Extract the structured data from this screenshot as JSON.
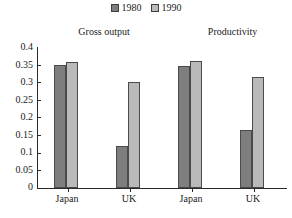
{
  "chart_data": {
    "type": "bar",
    "title": "",
    "subtitle": "",
    "xlabel": "",
    "ylabel": "",
    "ylim": [
      0,
      0.4
    ],
    "yticks": [
      "0",
      "0.05",
      "0.1",
      "0.15",
      "0.2",
      "0.25",
      "0.3",
      "0.35",
      "0.4"
    ],
    "ytick_values": [
      0,
      0.05,
      0.1,
      0.15,
      0.2,
      0.25,
      0.3,
      0.35,
      0.4
    ],
    "grid": false,
    "legend_position": "top-center",
    "group_labels": [
      "Gross output",
      "Productivity"
    ],
    "categories": [
      "Japan",
      "UK",
      "Japan",
      "UK"
    ],
    "series": [
      {
        "name": "1980",
        "color": "#7e7e7e",
        "values": [
          0.35,
          0.12,
          0.345,
          0.165
        ]
      },
      {
        "name": "1990",
        "color": "#b9b9b9",
        "values": [
          0.357,
          0.3,
          0.36,
          0.315
        ]
      }
    ],
    "legend": [
      {
        "label": "1980",
        "swatch": "#7e7e7e"
      },
      {
        "label": "1990",
        "swatch": "#b9b9b9"
      }
    ]
  }
}
